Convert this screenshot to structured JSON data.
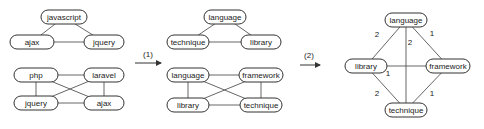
{
  "graphs": [
    {
      "id": "g1",
      "nodes": [
        {
          "id": "javascript",
          "label": "javascript",
          "x": 64,
          "y": 17,
          "w": 46
        },
        {
          "id": "ajax",
          "label": "ajax",
          "x": 32,
          "y": 42,
          "w": 44
        },
        {
          "id": "jquery",
          "label": "jquery",
          "x": 104,
          "y": 42,
          "w": 40
        }
      ],
      "edges": [
        [
          "javascript",
          "ajax"
        ],
        [
          "javascript",
          "jquery"
        ],
        [
          "ajax",
          "jquery"
        ]
      ]
    },
    {
      "id": "g2",
      "nodes": [
        {
          "id": "php",
          "label": "php",
          "x": 36,
          "y": 75,
          "w": 44
        },
        {
          "id": "laravel",
          "label": "laravel",
          "x": 104,
          "y": 75,
          "w": 40
        },
        {
          "id": "jquery",
          "label": "jquery",
          "x": 36,
          "y": 103,
          "w": 44
        },
        {
          "id": "ajax",
          "label": "ajax",
          "x": 104,
          "y": 103,
          "w": 40
        }
      ],
      "edges": [
        [
          "php",
          "laravel"
        ],
        [
          "php",
          "jquery"
        ],
        [
          "php",
          "ajax"
        ],
        [
          "laravel",
          "jquery"
        ],
        [
          "laravel",
          "ajax"
        ],
        [
          "jquery",
          "ajax"
        ]
      ]
    },
    {
      "id": "g3",
      "nodes": [
        {
          "id": "language",
          "label": "language",
          "x": 225,
          "y": 17,
          "w": 42
        },
        {
          "id": "technique",
          "label": "technique",
          "x": 188,
          "y": 42,
          "w": 42
        },
        {
          "id": "library",
          "label": "library",
          "x": 261,
          "y": 42,
          "w": 40
        }
      ],
      "edges": [
        [
          "language",
          "technique"
        ],
        [
          "language",
          "library"
        ],
        [
          "technique",
          "library"
        ]
      ]
    },
    {
      "id": "g4",
      "nodes": [
        {
          "id": "language",
          "label": "language",
          "x": 188,
          "y": 75,
          "w": 42
        },
        {
          "id": "framework",
          "label": "framework",
          "x": 261,
          "y": 75,
          "w": 44
        },
        {
          "id": "library",
          "label": "library",
          "x": 188,
          "y": 105,
          "w": 42
        },
        {
          "id": "technique",
          "label": "technique",
          "x": 261,
          "y": 105,
          "w": 42
        }
      ],
      "edges": [
        [
          "language",
          "framework"
        ],
        [
          "language",
          "library"
        ],
        [
          "language",
          "technique"
        ],
        [
          "framework",
          "library"
        ],
        [
          "framework",
          "technique"
        ],
        [
          "library",
          "technique"
        ]
      ]
    },
    {
      "id": "g5",
      "nodes": [
        {
          "id": "language",
          "label": "language",
          "x": 406,
          "y": 20,
          "w": 42
        },
        {
          "id": "library",
          "label": "library",
          "x": 366,
          "y": 66,
          "w": 42
        },
        {
          "id": "framework",
          "label": "framework",
          "x": 448,
          "y": 66,
          "w": 44
        },
        {
          "id": "technique",
          "label": "technique",
          "x": 406,
          "y": 110,
          "w": 42
        }
      ],
      "edges": [
        {
          "from": "language",
          "to": "library",
          "weight": "2",
          "lx": 377,
          "ly": 37
        },
        {
          "from": "language",
          "to": "technique",
          "weight": "2",
          "lx": 410,
          "ly": 45
        },
        {
          "from": "language",
          "to": "framework",
          "weight": "1",
          "lx": 432,
          "ly": 36
        },
        {
          "from": "library",
          "to": "framework",
          "weight": "1",
          "lx": 388,
          "ly": 76
        },
        {
          "from": "library",
          "to": "technique",
          "weight": "2",
          "lx": 377,
          "ly": 96
        },
        {
          "from": "framework",
          "to": "technique",
          "weight": "1",
          "lx": 432,
          "ly": 96
        }
      ]
    }
  ],
  "arrows": [
    {
      "label": "(1)",
      "x1": 135,
      "x2": 161,
      "y": 63,
      "lx": 148,
      "ly": 57
    },
    {
      "label": "(2)",
      "x1": 300,
      "x2": 320,
      "y": 65,
      "lx": 309,
      "ly": 58
    }
  ]
}
